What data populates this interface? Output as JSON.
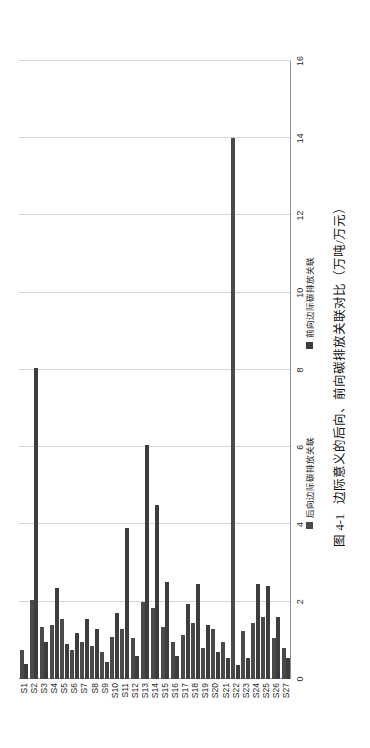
{
  "page_header": "",
  "legend": {
    "items": [
      {
        "label": "后向边际碳排放关联",
        "color": "#4a4a4a"
      },
      {
        "label": "前向边际碳排放关联",
        "color": "#3d3d3d"
      }
    ]
  },
  "caption": {
    "number": "图 4-1",
    "text": "边际意义的后向、前向碳排放关联对比（万吨/万元）"
  },
  "chart_data": {
    "type": "bar",
    "orientation": "horizontal",
    "title": "边际意义的后向、前向碳排放关联对比（万吨/万元）",
    "xlabel": "",
    "ylabel": "",
    "xlim": [
      0,
      16
    ],
    "grid": true,
    "legend_position": "bottom",
    "tick_labels": [
      "0",
      "2",
      "4",
      "6",
      "8",
      "10",
      "12",
      "14",
      "16"
    ],
    "ticks": [
      0,
      2,
      4,
      6,
      8,
      10,
      12,
      14,
      16
    ],
    "categories": [
      "S1",
      "S2",
      "S3",
      "S4",
      "S5",
      "S6",
      "S7",
      "S8",
      "S9",
      "S10",
      "S11",
      "S12",
      "S13",
      "S14",
      "S15",
      "S16",
      "S17",
      "S18",
      "S19",
      "S20",
      "S21",
      "S22",
      "S23",
      "S24",
      "S25",
      "S26",
      "S27"
    ],
    "series": [
      {
        "name": "后向边际碳排放关联",
        "color": "#4a4a4a",
        "values": [
          0.75,
          2.05,
          1.35,
          1.4,
          1.55,
          0.75,
          0.95,
          0.85,
          0.7,
          1.1,
          1.3,
          1.05,
          2.0,
          1.85,
          1.35,
          0.95,
          1.15,
          1.45,
          0.8,
          1.3,
          0.95,
          14.0,
          1.25,
          1.45,
          1.6,
          1.05,
          0.8
        ]
      },
      {
        "name": "前向边际碳排放关联",
        "color": "#3d3d3d",
        "values": [
          0.4,
          8.05,
          0.95,
          2.35,
          0.9,
          1.2,
          1.55,
          1.3,
          0.45,
          1.7,
          3.9,
          0.6,
          6.05,
          4.5,
          2.5,
          0.6,
          1.95,
          2.45,
          1.4,
          0.7,
          0.55,
          0.35,
          0.55,
          2.45,
          2.4,
          1.6,
          0.55
        ]
      }
    ]
  }
}
